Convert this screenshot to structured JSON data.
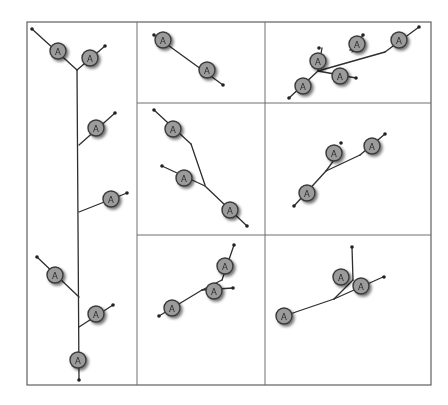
{
  "figure": {
    "width": 448,
    "height": 405,
    "frame": {
      "x1": 27,
      "y1": 22,
      "x2": 431,
      "y2": 385
    },
    "grid": {
      "vertical": [
        {
          "x": 137,
          "y1": 22,
          "y2": 385
        },
        {
          "x": 265,
          "y1": 22,
          "y2": 385
        }
      ],
      "horizontal": [
        {
          "y": 103,
          "x1": 137,
          "x2": 431
        },
        {
          "y": 235,
          "x1": 137,
          "x2": 431
        }
      ]
    },
    "colors": {
      "node_fill": "#9b9b9b",
      "node_stroke": "#3a3a3a",
      "edge": "#2e2e2e",
      "grid": "#6f6f6f"
    },
    "node_label": "A",
    "node_radius": 8
  },
  "panels": [
    {
      "id": "left-tall",
      "edges": [
        [
          [
            32,
            29
          ],
          [
            77,
            70
          ]
        ],
        [
          [
            77,
            70
          ],
          [
            105,
            46
          ]
        ],
        [
          [
            77,
            70
          ],
          [
            79,
            380
          ]
        ],
        [
          [
            79,
            145
          ],
          [
            115,
            113
          ]
        ],
        [
          [
            79,
            212
          ],
          [
            127,
            193
          ]
        ],
        [
          [
            37,
            257
          ],
          [
            79,
            297
          ]
        ],
        [
          [
            79,
            327
          ],
          [
            113,
            305
          ]
        ]
      ],
      "tips": [
        [
          32,
          29
        ],
        [
          105,
          46
        ],
        [
          115,
          113
        ],
        [
          127,
          193
        ],
        [
          37,
          257
        ],
        [
          113,
          305
        ],
        [
          79,
          380
        ]
      ],
      "nodes": [
        [
          58,
          51
        ],
        [
          90,
          58
        ],
        [
          96,
          128
        ],
        [
          111,
          199
        ],
        [
          55,
          275
        ],
        [
          96,
          314
        ],
        [
          78,
          360
        ]
      ]
    },
    {
      "id": "top-middle",
      "edges": [
        [
          [
            154,
            35
          ],
          [
            223,
            85
          ]
        ]
      ],
      "tips": [
        [
          154,
          35
        ],
        [
          223,
          85
        ]
      ],
      "nodes": [
        [
          163,
          40
        ],
        [
          207,
          70
        ]
      ]
    },
    {
      "id": "top-right",
      "edges": [
        [
          [
            289,
            98
          ],
          [
            318,
            71
          ]
        ],
        [
          [
            318,
            71
          ],
          [
            385,
            52
          ]
        ],
        [
          [
            385,
            52
          ],
          [
            419,
            27
          ]
        ],
        [
          [
            318,
            71
          ],
          [
            322,
            48
          ]
        ],
        [
          [
            318,
            71
          ],
          [
            356,
            78
          ]
        ],
        [
          [
            356,
            78
          ],
          [
            356,
            78
          ]
        ],
        [
          [
            350,
            50
          ],
          [
            362,
            47
          ]
        ],
        [
          [
            352,
            52
          ],
          [
            363,
            35
          ]
        ]
      ],
      "tips": [
        [
          289,
          98
        ],
        [
          419,
          27
        ],
        [
          319,
          48
        ],
        [
          363,
          35
        ],
        [
          356,
          78
        ]
      ],
      "nodes": [
        [
          303,
          86
        ],
        [
          318,
          61
        ],
        [
          357,
          44
        ],
        [
          340,
          76
        ],
        [
          399,
          40
        ]
      ]
    },
    {
      "id": "middle-middle",
      "edges": [
        [
          [
            154,
            110
          ],
          [
            191,
            144
          ]
        ],
        [
          [
            191,
            144
          ],
          [
            205,
            185
          ]
        ],
        [
          [
            162,
            166
          ],
          [
            205,
            186
          ]
        ],
        [
          [
            205,
            186
          ],
          [
            247,
            226
          ]
        ]
      ],
      "tips": [
        [
          154,
          110
        ],
        [
          162,
          166
        ],
        [
          247,
          226
        ]
      ],
      "nodes": [
        [
          173,
          129
        ],
        [
          184,
          178
        ],
        [
          230,
          210
        ]
      ]
    },
    {
      "id": "middle-right",
      "edges": [
        [
          [
            294,
            206
          ],
          [
            326,
            171
          ]
        ],
        [
          [
            326,
            171
          ],
          [
            334,
            160
          ]
        ],
        [
          [
            326,
            171
          ],
          [
            360,
            155
          ]
        ],
        [
          [
            360,
            155
          ],
          [
            385,
            134
          ]
        ]
      ],
      "tips": [
        [
          294,
          206
        ],
        [
          341,
          143
        ],
        [
          385,
          134
        ]
      ],
      "nodes": [
        [
          307,
          193
        ],
        [
          334,
          153
        ],
        [
          372,
          146
        ]
      ]
    },
    {
      "id": "bottom-middle",
      "edges": [
        [
          [
            159,
            316
          ],
          [
            202,
            290
          ]
        ],
        [
          [
            202,
            290
          ],
          [
            222,
            280
          ]
        ],
        [
          [
            222,
            280
          ],
          [
            234,
            245
          ]
        ],
        [
          [
            202,
            290
          ],
          [
            233,
            288
          ]
        ]
      ],
      "tips": [
        [
          159,
          316
        ],
        [
          234,
          245
        ],
        [
          233,
          288
        ]
      ],
      "nodes": [
        [
          172,
          308
        ],
        [
          225,
          266
        ],
        [
          214,
          291
        ]
      ]
    },
    {
      "id": "bottom-right",
      "edges": [
        [
          [
            284,
            316
          ],
          [
            334,
            299
          ]
        ],
        [
          [
            334,
            299
          ],
          [
            353,
            280
          ]
        ],
        [
          [
            353,
            280
          ],
          [
            352,
            247
          ]
        ],
        [
          [
            334,
            299
          ],
          [
            383,
            277
          ]
        ],
        [
          [
            383,
            277
          ],
          [
            383,
            277
          ]
        ]
      ],
      "tips": [
        [
          352,
          247
        ],
        [
          384,
          277
        ]
      ],
      "nodes": [
        [
          284,
          316
        ],
        [
          341,
          277
        ],
        [
          361,
          286
        ]
      ]
    }
  ]
}
